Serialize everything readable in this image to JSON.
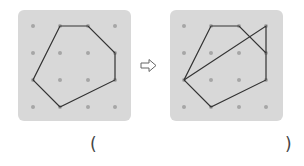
{
  "colors": {
    "panel_bg": "#d8d8d8",
    "dot": "#a6a6a6",
    "line": "#333333",
    "arrow": "#666666"
  },
  "grid": {
    "rows": 4,
    "cols": 4,
    "spacing_px": 27
  },
  "left_figure": {
    "description": "Hexagon drawn on 4x4 dot grid",
    "polygon_grid_points": [
      [
        1,
        0
      ],
      [
        2,
        0
      ],
      [
        3,
        1
      ],
      [
        3,
        2
      ],
      [
        1,
        3
      ],
      [
        0,
        2
      ]
    ]
  },
  "right_figure": {
    "description": "Same hexagon with an additional segment from (0,2) to (3,0) and (3,0) to (3,1)",
    "polygon_grid_points": [
      [
        1,
        0
      ],
      [
        2,
        0
      ],
      [
        3,
        1
      ],
      [
        3,
        2
      ],
      [
        1,
        3
      ],
      [
        0,
        2
      ]
    ],
    "extra_segments": [
      [
        [
          0,
          2
        ],
        [
          3,
          0
        ]
      ],
      [
        [
          3,
          0
        ],
        [
          3,
          1
        ]
      ]
    ]
  },
  "arrow": {
    "icon": "outlined-right-arrow"
  },
  "answer": {
    "open": "(",
    "close": ")",
    "value": ""
  }
}
